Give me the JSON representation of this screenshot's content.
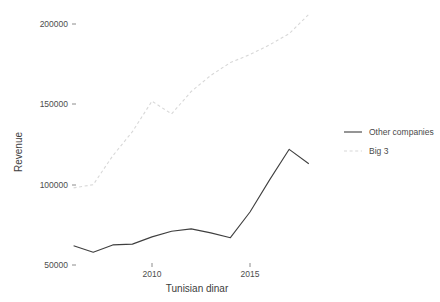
{
  "chart_data": {
    "type": "line",
    "title": "",
    "xlabel": "Tunisian dinar",
    "ylabel": "Revenue",
    "xlim": [
      2005.6,
      2018.0
    ],
    "ylim": [
      44000,
      212000
    ],
    "grid": false,
    "legend_position": "right",
    "x_ticks": [
      2010,
      2015
    ],
    "x_tick_labels": [
      "2010",
      "2015"
    ],
    "y_ticks": [
      50000,
      100000,
      150000,
      200000
    ],
    "y_tick_labels": [
      "50000",
      "100000",
      "150000",
      "200000"
    ],
    "x": [
      2006,
      2007,
      2008,
      2009,
      2010,
      2011,
      2012,
      2013,
      2014,
      2015,
      2016,
      2017,
      2018
    ],
    "series": [
      {
        "name": "Other companies",
        "style": "solid",
        "color": "#3f3f3f",
        "values": [
          62000,
          58000,
          62500,
          63000,
          67500,
          71000,
          72500,
          70000,
          67000,
          83000,
          103000,
          122000,
          113000
        ]
      },
      {
        "name": "Big 3",
        "style": "dashed",
        "color": "#d8d8d8",
        "values": [
          98000,
          100000,
          118000,
          133000,
          152000,
          144000,
          158000,
          168000,
          176000,
          181000,
          187000,
          194000,
          206000
        ]
      }
    ]
  },
  "legend": {
    "entries": [
      {
        "label": "Other companies",
        "swatch": "solid-line-swatch"
      },
      {
        "label": "Big 3",
        "swatch": "dashed-line-swatch"
      }
    ]
  },
  "colors": {
    "series_other": "#3f3f3f",
    "series_big3": "#d8d8d8",
    "text": "#3d3d3d",
    "background": "#ffffff"
  }
}
